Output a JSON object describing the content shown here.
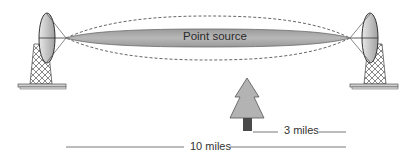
{
  "diagram": {
    "beam_label": "Point source",
    "short_distance_label": "3 miles",
    "long_distance_label": "10 miles",
    "elements": [
      "left-antenna-dish",
      "right-antenna-dish",
      "beam",
      "dashed-envelope",
      "tree"
    ],
    "colors": {
      "beam_fill": "#a8a8a8",
      "tree_fill": "#b3b3b3",
      "trunk_fill": "#4a4a4a",
      "line": "#555555",
      "dish_fill": "#c8c8c8"
    }
  }
}
